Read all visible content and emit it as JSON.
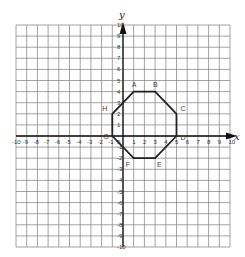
{
  "diagram": {
    "type": "coordinate-plane",
    "x_axis_label": "x",
    "y_axis_label": "y",
    "x_range": [
      -10,
      10
    ],
    "y_range": [
      -10,
      10
    ],
    "grid": true,
    "colors": {
      "grid": "#8a8a8a",
      "axis": "#111111",
      "shape": "#222222",
      "text": "#333333"
    },
    "x_ticks": [
      "-10",
      "-9",
      "-8",
      "-7",
      "-6",
      "-5",
      "-4",
      "-3",
      "-2",
      "-1",
      "1",
      "2",
      "3",
      "4",
      "5",
      "6",
      "7",
      "8",
      "9",
      "10"
    ],
    "y_ticks": [
      "10",
      "9",
      "8",
      "7",
      "6",
      "5",
      "4",
      "3",
      "2",
      "1",
      "-1",
      "-2",
      "-3",
      "-4",
      "-5",
      "-6",
      "-7",
      "-8",
      "-9",
      "-10"
    ],
    "origin_label": "0",
    "shape": {
      "name": "octagon",
      "vertices": [
        {
          "label": "A",
          "x": 1,
          "y": 4
        },
        {
          "label": "B",
          "x": 3,
          "y": 4
        },
        {
          "label": "C",
          "x": 5,
          "y": 2
        },
        {
          "label": "D",
          "x": 5,
          "y": 0
        },
        {
          "label": "E",
          "x": 3,
          "y": -2
        },
        {
          "label": "F",
          "x": 1,
          "y": -2
        },
        {
          "label": "G",
          "x": -1,
          "y": 0
        },
        {
          "label": "H",
          "x": -1,
          "y": 2
        }
      ]
    }
  }
}
